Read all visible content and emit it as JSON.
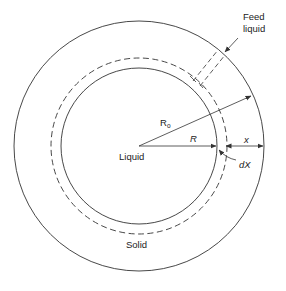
{
  "diagram": {
    "labels": {
      "feed_line1": "Feed",
      "feed_line2": "liquid",
      "r0_main": "R",
      "r0_sub": "o",
      "r": "R",
      "x": "x",
      "dx": "dX",
      "liquid": "Liquid",
      "solid": "Solid"
    },
    "colors": {
      "stroke": "#333333",
      "background": "#ffffff"
    },
    "geometry": {
      "center": [
        139,
        146
      ],
      "outer_radius": 125,
      "dashed_radius": 88,
      "inner_radius": 78
    }
  }
}
